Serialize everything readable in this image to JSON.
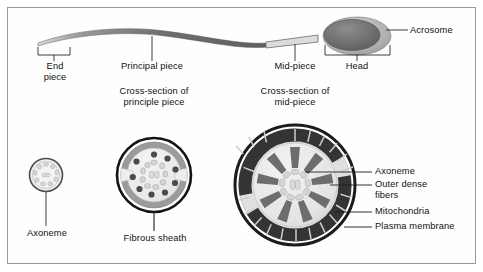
{
  "figure": {
    "type": "labelled biological diagram",
    "background_color": "#ffffff",
    "frame_color": "#9a9a9a"
  },
  "whole_cell": {
    "name": "spermatozoon-overview",
    "labels": {
      "end_piece": "End\npiece",
      "end_piece_line1": "End",
      "end_piece_line2": "piece",
      "principal_piece": "Principal piece",
      "mid_piece": "Mid-piece",
      "head": "Head",
      "acrosome": "Acrosome"
    },
    "colors": {
      "tail": "#7c7c7c",
      "mid_piece_tube": "#d8d8d8",
      "head_outer": "#b5b5b5",
      "head_inner": "#6f6f6f"
    }
  },
  "axoneme_panel": {
    "name": "axoneme-cross-section",
    "label": "Axoneme",
    "doublet_count": 9,
    "colors": {
      "membrane": "#4a4a4a",
      "fill": "#e9e9e9",
      "doublet": "#d2d2d2"
    }
  },
  "principal_piece_panel": {
    "name": "principal-piece-cross-section",
    "title_line1": "Cross-section of",
    "title_line2": "principle piece",
    "label": "Fibrous sheath",
    "outer_dense_fiber_count": 9,
    "colors": {
      "plasma_membrane": "#1c1c1c",
      "fibrous_sheath": "#8a8a8a",
      "cytoplasm": "#ededed",
      "dense_fiber": "#6a6a6a",
      "doublet": "#d0d0d0"
    }
  },
  "mid_piece_panel": {
    "name": "mid-piece-cross-section",
    "title_line1": "Cross-section of",
    "title_line2": "mid-piece",
    "outer_dense_fiber_count": 9,
    "mitochondria_arc_count": 2,
    "labels": [
      {
        "id": "axoneme",
        "text": "Axoneme"
      },
      {
        "id": "outer-dense-fibers",
        "text": "Outer dense",
        "text2": "fibers"
      },
      {
        "id": "mitochondria",
        "text": "Mitochondria"
      },
      {
        "id": "plasma-membrane",
        "text": "Plasma membrane"
      }
    ],
    "label_texts": {
      "axoneme": "Axoneme",
      "outer_dense_1": "Outer dense",
      "outer_dense_2": "fibers",
      "mitochondria": "Mitochondria",
      "plasma_membrane": "Plasma membrane"
    },
    "colors": {
      "plasma_membrane": "#1f1f1f",
      "mitochondria": "#3a3a3a",
      "mitochondria_cristae": "#cfcfcf",
      "cytoplasm": "#ececec",
      "outer_ring_fill": "#dedede",
      "dense_fiber": "#6e6e6e",
      "doublet": "#d4d4d4"
    }
  }
}
